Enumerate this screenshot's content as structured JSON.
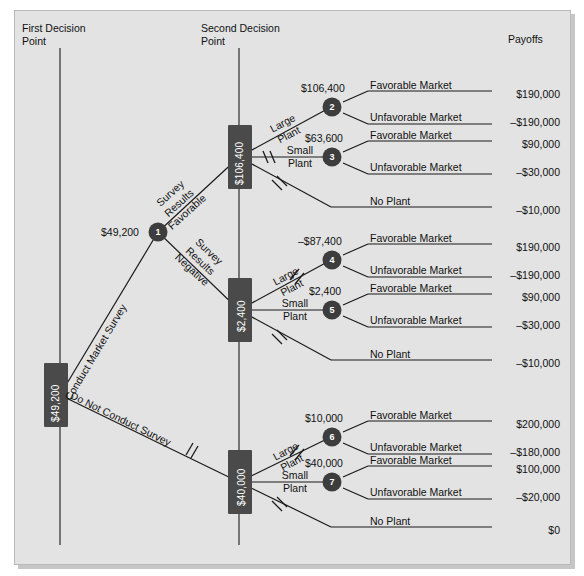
{
  "figure": {
    "type": "decision-tree",
    "headers": {
      "first_decision": "First Decision\nPoint",
      "first_decision_l1": "First Decision",
      "first_decision_l2": "Point",
      "second_decision_l1": "Second Decision",
      "second_decision_l2": "Point",
      "payoffs": "Payoffs"
    },
    "colors": {
      "panel_bg": "#e3e3e3",
      "line": "#1a1a1a",
      "decision_box": "#4a4a4a",
      "chance_node": "#3d3d3d",
      "text": "#111111",
      "box_text": "#ffffff"
    }
  },
  "decision_boxes": [
    {
      "id": "root",
      "value": "$49,200"
    },
    {
      "id": "survey-favorable",
      "value": "$106,400"
    },
    {
      "id": "survey-negative",
      "value": "$2,400"
    },
    {
      "id": "no-survey",
      "value": "$40,000"
    }
  ],
  "chance_nodes": [
    {
      "id": 1,
      "label": "1",
      "emv": "$49,200"
    },
    {
      "id": 2,
      "label": "2",
      "emv": "$106,400"
    },
    {
      "id": 3,
      "label": "3",
      "emv": "$63,600"
    },
    {
      "id": 4,
      "label": "4",
      "emv": "–$87,400"
    },
    {
      "id": 5,
      "label": "5",
      "emv": "$2,400"
    },
    {
      "id": 6,
      "label": "6",
      "emv": "$10,000"
    },
    {
      "id": 7,
      "label": "7",
      "emv": "$40,000"
    }
  ],
  "branch_labels": {
    "conduct_survey": "Conduct Market Survey",
    "do_not_conduct_survey": "Do Not Conduct Survey",
    "survey_favorable_l1": "Survey",
    "survey_favorable_l2": "Results",
    "survey_favorable_l3": "Favorable",
    "survey_negative_l1": "Survey",
    "survey_negative_l2": "Results",
    "survey_negative_l3": "Negative",
    "large_plant_l1": "Large",
    "large_plant_l2": "Plant",
    "small_plant_l1": "Small",
    "small_plant_l2": "Plant",
    "no_plant": "No Plant",
    "favorable_market": "Favorable Market",
    "unfavorable_market": "Unfavorable Market"
  },
  "branches": [
    {
      "group": "survey-favorable",
      "emv_large": "$106,400",
      "emv_small": "$63,600",
      "outcomes": [
        {
          "label": "Favorable Market",
          "payoff": "$190,000"
        },
        {
          "label": "Unfavorable Market",
          "payoff": "–$190,000"
        },
        {
          "label": "Favorable Market",
          "payoff": "$90,000"
        },
        {
          "label": "Unfavorable Market",
          "payoff": "–$30,000"
        },
        {
          "label": "No Plant",
          "payoff": "–$10,000"
        }
      ]
    },
    {
      "group": "survey-negative",
      "emv_large": "–$87,400",
      "emv_small": "$2,400",
      "outcomes": [
        {
          "label": "Favorable Market",
          "payoff": "$190,000"
        },
        {
          "label": "Unfavorable Market",
          "payoff": "–$190,000"
        },
        {
          "label": "Favorable Market",
          "payoff": "$90,000"
        },
        {
          "label": "Unfavorable Market",
          "payoff": "–$30,000"
        },
        {
          "label": "No Plant",
          "payoff": "–$10,000"
        }
      ]
    },
    {
      "group": "no-survey",
      "emv_large": "$10,000",
      "emv_small": "$40,000",
      "outcomes": [
        {
          "label": "Favorable Market",
          "payoff": "$200,000"
        },
        {
          "label": "Unfavorable Market",
          "payoff": "–$180,000"
        },
        {
          "label": "Favorable Market",
          "payoff": "$100,000"
        },
        {
          "label": "Unfavorable Market",
          "payoff": "–$20,000"
        },
        {
          "label": "No Plant",
          "payoff": "$0"
        }
      ]
    }
  ],
  "payoff_column": [
    "$190,000",
    "–$190,000",
    "$90,000",
    "–$30,000",
    "–$10,000",
    "$190,000",
    "–$190,000",
    "$90,000",
    "–$30,000",
    "–$10,000",
    "$200,000",
    "–$180,000",
    "$100,000",
    "–$20,000",
    "$0"
  ],
  "emv_labels": [
    "$49,200",
    "$106,400",
    "$63,600",
    "–$87,400",
    "$2,400",
    "$10,000",
    "$40,000"
  ]
}
